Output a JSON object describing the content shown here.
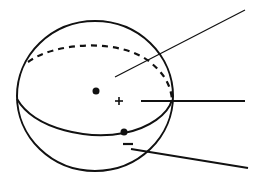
{
  "diagram": {
    "type": "sphere-with-great-circle",
    "colors": {
      "background": "#ffffff",
      "stroke": "#111111"
    },
    "sphere": {
      "cx": 95,
      "cy": 96,
      "rx": 78,
      "ry": 75
    },
    "great_circle_front": "M17,99 C35,130 90,140 124,133 C150,128 168,114 172,100",
    "great_circle_back_dashed": "M28,62 C55,42 120,38 150,62 C162,72 170,82 172,99",
    "points": [
      {
        "name": "center-point",
        "x": 96,
        "y": 91,
        "r": 3.5
      },
      {
        "name": "surface-point",
        "x": 124,
        "y": 132,
        "r": 3.5
      }
    ],
    "signs": [
      {
        "name": "plus-sign",
        "symbol": "+",
        "x": 119,
        "y": 101
      },
      {
        "name": "minus-sign",
        "symbol": "−",
        "x": 128,
        "y": 144
      }
    ],
    "leader_lines": [
      {
        "name": "leader-line-top",
        "x1": 115,
        "y1": 77,
        "x2": 245,
        "y2": 10,
        "width": 1.2
      },
      {
        "name": "leader-line-middle",
        "x1": 141,
        "y1": 101,
        "x2": 245,
        "y2": 101,
        "width": 2
      },
      {
        "name": "leader-line-bottom",
        "x1": 131,
        "y1": 149,
        "x2": 248,
        "y2": 168,
        "width": 2
      }
    ]
  }
}
